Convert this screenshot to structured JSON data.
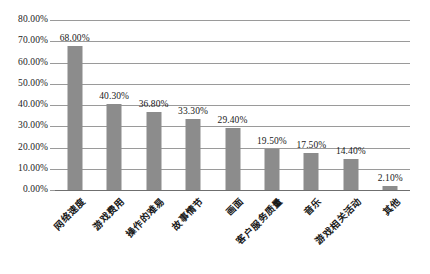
{
  "chart_data": {
    "type": "bar",
    "title": "",
    "subtitle": "",
    "xlabel": "",
    "ylabel": "",
    "grid": true,
    "legend": false,
    "ylim": [
      0,
      0.8
    ],
    "ytick_labels": [
      "80.00%",
      "70.00%",
      "60.00%",
      "50.00%",
      "40.00%",
      "30.00%",
      "20.00%",
      "10.00%",
      "0.00%"
    ],
    "ytick_values": [
      0.8,
      0.7,
      0.6,
      0.5,
      0.4,
      0.3,
      0.2,
      0.1,
      0.0
    ],
    "categories": [
      "网络速度",
      "游戏费用",
      "操作的难易",
      "故事情节",
      "画面",
      "客户服务质量",
      "音乐",
      "游戏相关活动",
      "其他"
    ],
    "values": [
      0.68,
      0.403,
      0.368,
      0.333,
      0.294,
      0.195,
      0.175,
      0.144,
      0.021
    ],
    "value_labels": [
      "68.00%",
      "40.30%",
      "36.80%",
      "33.30%",
      "29.40%",
      "19.50%",
      "17.50%",
      "14.40%",
      "2.10%"
    ],
    "bar_color": "#8c8c8c",
    "gridline_color": "#9a9a9a",
    "axis_color": "#6f6f6f",
    "background_color": "#ffffff"
  }
}
